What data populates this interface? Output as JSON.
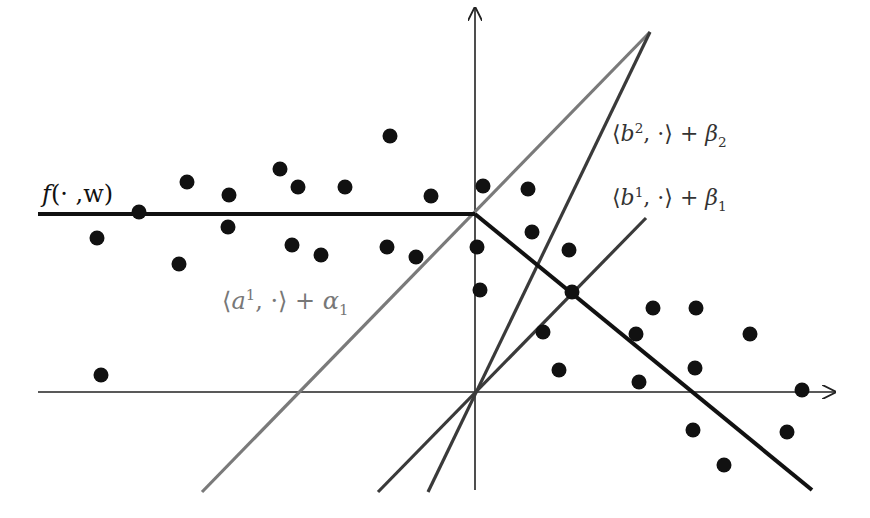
{
  "figure": {
    "origin_px": [
      475,
      392
    ],
    "colors": {
      "f_line": "#111111",
      "a1_line": "#7a7a7a",
      "b_lines": "#3a3a3a",
      "axes": "#222222",
      "points": "#111111",
      "background": "#ffffff"
    }
  },
  "labels": {
    "f": {
      "main": "f",
      "rest": "(· ,w)"
    },
    "a1": {
      "open": "⟨",
      "var": "a",
      "sup": "1",
      "mid": ", ·⟩ + ",
      "greek": "α",
      "sub": "1"
    },
    "b2": {
      "open": "⟨",
      "var": "b",
      "sup": "2",
      "mid": ", ·⟩ + ",
      "greek": "β",
      "sub": "2"
    },
    "b1": {
      "open": "⟨",
      "var": "b",
      "sup": "1",
      "mid": ", ·⟩ + ",
      "greek": "β",
      "sub": "1"
    }
  },
  "axes": {
    "x": {
      "x1": 38,
      "y1": 392,
      "x2": 835,
      "y2": 392
    },
    "y": {
      "x1": 475,
      "y1": 490,
      "x2": 475,
      "y2": 8
    }
  },
  "lines": {
    "f_flat": {
      "x1": 38,
      "y1": 214,
      "x2": 475,
      "y2": 214
    },
    "f_slope": {
      "x1": 475,
      "y1": 214,
      "x2": 812,
      "y2": 490
    },
    "a1": {
      "x1": 202,
      "y1": 492,
      "x2": 650,
      "y2": 32
    },
    "b2": {
      "x1": 428,
      "y1": 492,
      "x2": 650,
      "y2": 32
    },
    "b1": {
      "x1": 378,
      "y1": 492,
      "x2": 646,
      "y2": 218
    }
  },
  "points": [
    [
      97,
      238
    ],
    [
      139,
      212
    ],
    [
      179,
      264
    ],
    [
      187,
      182
    ],
    [
      229,
      195
    ],
    [
      228,
      227
    ],
    [
      280,
      169
    ],
    [
      298,
      187
    ],
    [
      292,
      245
    ],
    [
      321,
      255
    ],
    [
      345,
      187
    ],
    [
      390,
      136
    ],
    [
      387,
      247
    ],
    [
      416,
      257
    ],
    [
      431,
      196
    ],
    [
      483,
      186
    ],
    [
      477,
      247
    ],
    [
      480,
      290
    ],
    [
      528,
      189
    ],
    [
      532,
      232
    ],
    [
      569,
      250
    ],
    [
      572,
      292
    ],
    [
      543,
      332
    ],
    [
      559,
      370
    ],
    [
      653,
      308
    ],
    [
      696,
      308
    ],
    [
      636,
      334
    ],
    [
      639,
      382
    ],
    [
      750,
      334
    ],
    [
      695,
      368
    ],
    [
      802,
      390
    ],
    [
      693,
      430
    ],
    [
      787,
      432
    ],
    [
      724,
      465
    ],
    [
      101,
      375
    ]
  ]
}
